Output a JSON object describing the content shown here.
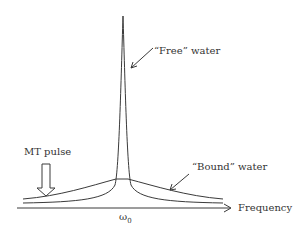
{
  "diagram": {
    "labels": {
      "free_water": "“Free” water",
      "bound_water": "“Bound” water",
      "mt_pulse": "MT pulse",
      "x_axis": "Frequency",
      "center_freq": "ω",
      "center_freq_sub": "0"
    },
    "colors": {
      "line": "#3a3a3a",
      "text": "#333333"
    },
    "curves": [
      {
        "name": "free-water-peak",
        "shape": "narrow lorentzian",
        "center": "ω0"
      },
      {
        "name": "bound-water-peak",
        "shape": "broad lorentzian",
        "center": "ω0"
      }
    ]
  }
}
